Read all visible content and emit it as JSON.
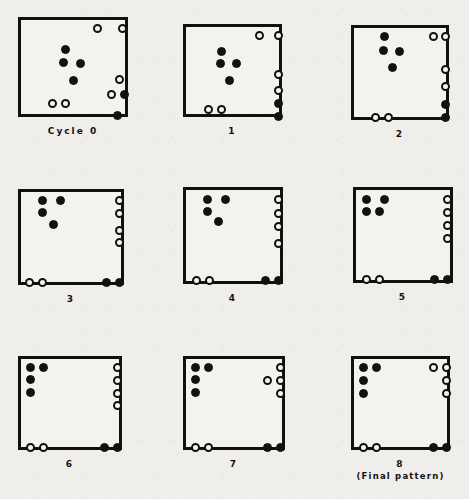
{
  "figure": {
    "background_color": "#efeeea",
    "ink_color": "#131110",
    "width": 469,
    "height": 499,
    "panel_count": 9
  },
  "legend": {
    "black_dot_label": "filled marker",
    "white_dot_label": "open marker"
  },
  "panels": [
    {
      "id": "panel-0",
      "caption": "Cycle 0",
      "subcaption": "",
      "box": {
        "x": 18,
        "y": 17,
        "w": 110,
        "h": 100
      },
      "dots": [
        {
          "type": "white",
          "x": 75,
          "y": 7
        },
        {
          "type": "white",
          "x": 100,
          "y": 7
        },
        {
          "type": "black",
          "x": 43,
          "y": 28
        },
        {
          "type": "black",
          "x": 41,
          "y": 41
        },
        {
          "type": "black",
          "x": 58,
          "y": 42
        },
        {
          "type": "black",
          "x": 51,
          "y": 59
        },
        {
          "type": "white",
          "x": 97,
          "y": 58
        },
        {
          "type": "white",
          "x": 89,
          "y": 73
        },
        {
          "type": "black",
          "x": 102,
          "y": 73
        },
        {
          "type": "white",
          "x": 30,
          "y": 82
        },
        {
          "type": "white",
          "x": 43,
          "y": 82
        },
        {
          "type": "black",
          "x": 95,
          "y": 94
        }
      ]
    },
    {
      "id": "panel-1",
      "caption": "1",
      "subcaption": "",
      "box": {
        "x": 183,
        "y": 24,
        "w": 99,
        "h": 93
      },
      "dots": [
        {
          "type": "white",
          "x": 72,
          "y": 7
        },
        {
          "type": "white",
          "x": 91,
          "y": 7
        },
        {
          "type": "black",
          "x": 34,
          "y": 23
        },
        {
          "type": "black",
          "x": 33,
          "y": 35
        },
        {
          "type": "black",
          "x": 49,
          "y": 35
        },
        {
          "type": "black",
          "x": 42,
          "y": 52
        },
        {
          "type": "white",
          "x": 91,
          "y": 46
        },
        {
          "type": "white",
          "x": 91,
          "y": 62
        },
        {
          "type": "black",
          "x": 91,
          "y": 75
        },
        {
          "type": "white",
          "x": 21,
          "y": 81
        },
        {
          "type": "white",
          "x": 34,
          "y": 81
        },
        {
          "type": "black",
          "x": 91,
          "y": 88
        }
      ]
    },
    {
      "id": "panel-2",
      "caption": "2",
      "subcaption": "",
      "box": {
        "x": 351,
        "y": 25,
        "w": 98,
        "h": 95
      },
      "dots": [
        {
          "type": "white",
          "x": 78,
          "y": 7
        },
        {
          "type": "white",
          "x": 90,
          "y": 7
        },
        {
          "type": "black",
          "x": 29,
          "y": 7
        },
        {
          "type": "black",
          "x": 28,
          "y": 21
        },
        {
          "type": "black",
          "x": 44,
          "y": 22
        },
        {
          "type": "black",
          "x": 37,
          "y": 38
        },
        {
          "type": "white",
          "x": 90,
          "y": 40
        },
        {
          "type": "white",
          "x": 90,
          "y": 57
        },
        {
          "type": "black",
          "x": 90,
          "y": 75
        },
        {
          "type": "black",
          "x": 90,
          "y": 88
        },
        {
          "type": "white",
          "x": 20,
          "y": 88
        },
        {
          "type": "white",
          "x": 33,
          "y": 88
        }
      ]
    },
    {
      "id": "panel-3",
      "caption": "3",
      "subcaption": "",
      "box": {
        "x": 18,
        "y": 189,
        "w": 106,
        "h": 96
      },
      "dots": [
        {
          "type": "black",
          "x": 20,
          "y": 7
        },
        {
          "type": "black",
          "x": 38,
          "y": 7
        },
        {
          "type": "black",
          "x": 20,
          "y": 19
        },
        {
          "type": "black",
          "x": 31,
          "y": 31
        },
        {
          "type": "white",
          "x": 97,
          "y": 7
        },
        {
          "type": "white",
          "x": 97,
          "y": 20
        },
        {
          "type": "white",
          "x": 97,
          "y": 37
        },
        {
          "type": "white",
          "x": 97,
          "y": 49
        },
        {
          "type": "white",
          "x": 7,
          "y": 89
        },
        {
          "type": "white",
          "x": 20,
          "y": 89
        },
        {
          "type": "black",
          "x": 84,
          "y": 89
        },
        {
          "type": "black",
          "x": 97,
          "y": 89
        }
      ]
    },
    {
      "id": "panel-4",
      "caption": "4",
      "subcaption": "",
      "box": {
        "x": 183,
        "y": 187,
        "w": 100,
        "h": 97
      },
      "dots": [
        {
          "type": "black",
          "x": 20,
          "y": 8
        },
        {
          "type": "black",
          "x": 38,
          "y": 8
        },
        {
          "type": "black",
          "x": 20,
          "y": 20
        },
        {
          "type": "black",
          "x": 31,
          "y": 30
        },
        {
          "type": "white",
          "x": 91,
          "y": 8
        },
        {
          "type": "white",
          "x": 91,
          "y": 22
        },
        {
          "type": "white",
          "x": 91,
          "y": 35
        },
        {
          "type": "white",
          "x": 91,
          "y": 52
        },
        {
          "type": "white",
          "x": 9,
          "y": 89
        },
        {
          "type": "white",
          "x": 22,
          "y": 89
        },
        {
          "type": "black",
          "x": 78,
          "y": 89
        },
        {
          "type": "black",
          "x": 91,
          "y": 89
        }
      ]
    },
    {
      "id": "panel-5",
      "caption": "5",
      "subcaption": "",
      "box": {
        "x": 353,
        "y": 187,
        "w": 100,
        "h": 96
      },
      "dots": [
        {
          "type": "black",
          "x": 9,
          "y": 8
        },
        {
          "type": "black",
          "x": 27,
          "y": 8
        },
        {
          "type": "black",
          "x": 9,
          "y": 20
        },
        {
          "type": "black",
          "x": 22,
          "y": 20
        },
        {
          "type": "white",
          "x": 90,
          "y": 8
        },
        {
          "type": "white",
          "x": 90,
          "y": 21
        },
        {
          "type": "white",
          "x": 90,
          "y": 34
        },
        {
          "type": "white",
          "x": 90,
          "y": 47
        },
        {
          "type": "white",
          "x": 9,
          "y": 88
        },
        {
          "type": "white",
          "x": 22,
          "y": 88
        },
        {
          "type": "black",
          "x": 77,
          "y": 88
        },
        {
          "type": "black",
          "x": 90,
          "y": 88
        }
      ]
    },
    {
      "id": "panel-6",
      "caption": "6",
      "subcaption": "",
      "box": {
        "x": 18,
        "y": 356,
        "w": 104,
        "h": 94
      },
      "dots": [
        {
          "type": "black",
          "x": 8,
          "y": 7
        },
        {
          "type": "black",
          "x": 21,
          "y": 7
        },
        {
          "type": "black",
          "x": 8,
          "y": 19
        },
        {
          "type": "black",
          "x": 8,
          "y": 32
        },
        {
          "type": "white",
          "x": 95,
          "y": 7
        },
        {
          "type": "white",
          "x": 95,
          "y": 20
        },
        {
          "type": "white",
          "x": 95,
          "y": 33
        },
        {
          "type": "white",
          "x": 95,
          "y": 45
        },
        {
          "type": "white",
          "x": 8,
          "y": 87
        },
        {
          "type": "white",
          "x": 21,
          "y": 87
        },
        {
          "type": "black",
          "x": 82,
          "y": 87
        },
        {
          "type": "black",
          "x": 95,
          "y": 87
        }
      ]
    },
    {
      "id": "panel-7",
      "caption": "7",
      "subcaption": "",
      "box": {
        "x": 183,
        "y": 356,
        "w": 102,
        "h": 94
      },
      "dots": [
        {
          "type": "black",
          "x": 8,
          "y": 7
        },
        {
          "type": "black",
          "x": 21,
          "y": 7
        },
        {
          "type": "black",
          "x": 8,
          "y": 19
        },
        {
          "type": "black",
          "x": 8,
          "y": 32
        },
        {
          "type": "white",
          "x": 93,
          "y": 7
        },
        {
          "type": "white",
          "x": 80,
          "y": 20
        },
        {
          "type": "white",
          "x": 93,
          "y": 20
        },
        {
          "type": "white",
          "x": 93,
          "y": 33
        },
        {
          "type": "white",
          "x": 8,
          "y": 87
        },
        {
          "type": "white",
          "x": 21,
          "y": 87
        },
        {
          "type": "black",
          "x": 80,
          "y": 87
        },
        {
          "type": "black",
          "x": 93,
          "y": 87
        }
      ]
    },
    {
      "id": "panel-8",
      "caption": "8",
      "subcaption": "(Final pattern)",
      "box": {
        "x": 351,
        "y": 356,
        "w": 99,
        "h": 94
      },
      "dots": [
        {
          "type": "black",
          "x": 8,
          "y": 7
        },
        {
          "type": "black",
          "x": 21,
          "y": 7
        },
        {
          "type": "black",
          "x": 8,
          "y": 20
        },
        {
          "type": "black",
          "x": 8,
          "y": 33
        },
        {
          "type": "white",
          "x": 78,
          "y": 7
        },
        {
          "type": "white",
          "x": 91,
          "y": 7
        },
        {
          "type": "white",
          "x": 91,
          "y": 20
        },
        {
          "type": "white",
          "x": 91,
          "y": 33
        },
        {
          "type": "white",
          "x": 8,
          "y": 87
        },
        {
          "type": "white",
          "x": 21,
          "y": 87
        },
        {
          "type": "black",
          "x": 78,
          "y": 87
        },
        {
          "type": "black",
          "x": 91,
          "y": 87
        }
      ]
    }
  ]
}
